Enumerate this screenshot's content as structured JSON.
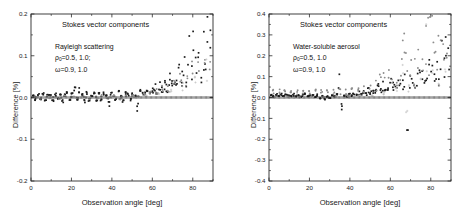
{
  "figure": {
    "background": "#ffffff",
    "panel_count": 2
  },
  "panels": [
    {
      "id": "left",
      "annotations": {
        "title": "Stokes vector components",
        "case": "Rayleigh scattering",
        "param1_symbol": "ρ",
        "param1_sub": "0",
        "param1_value": "=0.5, 1.0;",
        "param2_symbol": "ω",
        "param2_value": "=0.9, 1.0"
      },
      "axes": {
        "xlabel": "Observation angle [deg]",
        "ylabel": "Difference [%]",
        "xticks": [
          "0",
          "20",
          "40",
          "60",
          "80"
        ],
        "xtick_values": [
          0,
          20,
          40,
          60,
          80
        ],
        "yticks": [
          "0.2",
          "0.1",
          "0.0",
          "-0.1",
          "-0.2"
        ],
        "ytick_values": [
          0.2,
          0.1,
          0.0,
          -0.1,
          -0.2
        ],
        "xlim": [
          0,
          90
        ],
        "ylim": [
          -0.2,
          0.2
        ],
        "minor_x_step": 10,
        "minor_y_step": 0.05,
        "ticks_all_sides": true
      }
    },
    {
      "id": "right",
      "annotations": {
        "title": "Stokes vector components",
        "case": "Water-soluble aerosol",
        "param1_symbol": "ρ",
        "param1_sub": "0",
        "param1_value": "=0.5, 1.0",
        "param2_symbol": "ω",
        "param2_value": "=0.9, 1.0"
      },
      "axes": {
        "xlabel": "Observation angle [deg]",
        "ylabel": "Difference [%]",
        "xticks": [
          "0",
          "20",
          "40",
          "60",
          "80"
        ],
        "xtick_values": [
          0,
          20,
          40,
          60,
          80
        ],
        "yticks": [
          "0.4",
          "0.3",
          "0.2",
          "0.1",
          "0.0",
          "-0.1",
          "-0.2",
          "-0.3",
          "-0.4"
        ],
        "ytick_values": [
          0.4,
          0.3,
          0.2,
          0.1,
          0.0,
          -0.1,
          -0.2,
          -0.3,
          -0.4
        ],
        "xlim": [
          0,
          90
        ],
        "ylim": [
          -0.4,
          0.4
        ],
        "minor_x_step": 10,
        "minor_y_step": 0.05,
        "ticks_all_sides": true
      }
    }
  ],
  "bottom_caption": "",
  "colors": {
    "dark_marker": "#1c1c1c",
    "gray_marker": "#8c8c8c",
    "light_marker": "#bdbdbd",
    "axis": "#2b2b2b",
    "text": "#1a1a1a"
  },
  "chart_data": [
    {
      "type": "scatter",
      "panel": "left",
      "title": "Stokes vector components",
      "subtitle": "Rayleigh scattering",
      "xlabel": "Observation angle [deg]",
      "ylabel": "Difference [%]",
      "xlim": [
        0,
        90
      ],
      "ylim": [
        -0.2,
        0.2
      ],
      "grid": false,
      "legend": "none",
      "annotations": [
        "ρ₀=0.5, 1.0;",
        "ω=0.9, 1.0"
      ],
      "description": "Dense near-zero noise band for angles 0-60 deg (|diff| < 0.02%), fanning out to +0.17% near 88 deg. Three overlapping marker groups: dark squares, mid-gray circles, light-gray crosses.",
      "series": [
        {
          "name": "dark-squares",
          "color": "#1c1c1c",
          "marker": "square",
          "x": [
            1.2,
            2.4,
            3.6,
            4.8,
            6.0,
            7.2,
            8.4,
            9.6,
            10.8,
            12.0,
            13.2,
            14.4,
            15.6,
            16.8,
            18.0,
            19.2,
            20.4,
            21.6,
            22.8,
            24.0,
            25.2,
            26.4,
            27.6,
            28.8,
            30.0,
            31.2,
            32.4,
            33.6,
            34.8,
            36.0,
            37.2,
            38.4,
            39.6,
            40.8,
            42.0,
            43.2,
            44.4,
            45.6,
            46.8,
            48.0,
            49.2,
            50.4,
            51.6,
            52.8,
            54.0,
            55.2,
            56.4,
            57.6,
            58.8,
            60.0,
            61.2,
            62.4,
            63.6,
            64.8,
            66.0,
            67.2,
            68.4,
            69.6,
            70.8,
            72.0,
            73.2,
            74.4,
            75.6,
            76.8,
            78.0,
            79.2,
            80.4,
            81.6,
            82.8,
            84.0,
            85.2,
            86.4,
            87.6,
            88.8
          ],
          "y": [
            0.004,
            -0.005,
            0.006,
            -0.004,
            0.008,
            -0.007,
            0.005,
            0.009,
            -0.006,
            0.007,
            -0.003,
            0.01,
            -0.008,
            0.006,
            0.012,
            -0.005,
            0.014,
            0.018,
            -0.004,
            0.016,
            0.007,
            -0.009,
            0.011,
            -0.006,
            0.005,
            0.009,
            -0.012,
            0.008,
            -0.005,
            0.01,
            0.006,
            -0.014,
            0.009,
            0.004,
            -0.007,
            0.012,
            0.005,
            -0.009,
            0.011,
            0.007,
            -0.006,
            0.01,
            0.004,
            -0.029,
            0.013,
            0.008,
            0.011,
            0.017,
            0.009,
            0.015,
            0.022,
            0.012,
            0.028,
            0.018,
            0.035,
            0.024,
            0.042,
            0.031,
            0.055,
            0.038,
            0.065,
            0.047,
            0.072,
            0.052,
            0.095,
            0.061,
            0.104,
            0.068,
            0.085,
            0.058,
            0.112,
            0.074,
            0.168,
            0.155
          ]
        },
        {
          "name": "mid-gray-circles",
          "color": "#8c8c8c",
          "marker": "circle",
          "x": [
            2.0,
            5.0,
            8.0,
            11.0,
            14.0,
            17.0,
            20.0,
            23.0,
            26.0,
            29.0,
            32.0,
            35.0,
            38.0,
            41.0,
            44.0,
            47.0,
            50.0,
            53.0,
            56.0,
            59.0,
            62.0,
            65.0,
            68.0,
            71.0,
            74.0,
            77.0,
            80.0,
            83.0,
            86.0,
            88.5
          ],
          "y": [
            0.002,
            -0.002,
            0.003,
            0.001,
            -0.003,
            0.004,
            0.002,
            -0.001,
            0.003,
            -0.004,
            0.002,
            0.005,
            -0.002,
            0.003,
            -0.005,
            0.004,
            0.006,
            0.003,
            0.008,
            0.01,
            0.014,
            0.02,
            0.027,
            0.033,
            0.041,
            0.049,
            0.058,
            0.066,
            0.078,
            0.088
          ]
        },
        {
          "name": "light-gray-crosses",
          "color": "#bdbdbd",
          "marker": "cross",
          "x": [
            3.0,
            9.0,
            15.0,
            21.0,
            27.0,
            33.0,
            39.0,
            45.0,
            51.0,
            57.0,
            63.0,
            69.0,
            75.0,
            81.0,
            87.0
          ],
          "y": [
            0.001,
            0.0,
            -0.001,
            0.002,
            0.0,
            -0.002,
            0.001,
            0.0,
            0.002,
            0.004,
            0.008,
            0.016,
            0.027,
            0.04,
            0.06
          ]
        },
        {
          "name": "zero-baseline-ticks",
          "color": "#1c1c1c",
          "marker": "tick",
          "x": [
            0,
            90
          ],
          "y": [
            0.0,
            0.0
          ]
        }
      ]
    },
    {
      "type": "scatter",
      "panel": "right",
      "title": "Stokes vector components",
      "subtitle": "Water-soluble aerosol",
      "xlabel": "Observation angle [deg]",
      "ylabel": "Difference [%]",
      "xlim": [
        0,
        90
      ],
      "ylim": [
        -0.4,
        0.4
      ],
      "grid": false,
      "legend": "none",
      "annotations": [
        "ρ₀=0.5, 1.0",
        "ω=0.9, 1.0"
      ],
      "description": "A near-flat gray band at about +0.03% across all angles, dark noise band near zero, rising scatter after 55 deg with peaks to +0.39% near 80 deg and outliers down to -0.12% near 68 deg.",
      "series": [
        {
          "name": "dark-squares",
          "color": "#1c1c1c",
          "marker": "square",
          "x": [
            1.2,
            2.4,
            3.6,
            4.8,
            6.0,
            7.2,
            8.4,
            9.6,
            10.8,
            12.0,
            13.2,
            14.4,
            15.6,
            16.8,
            18.0,
            19.2,
            20.4,
            21.6,
            22.8,
            24.0,
            25.2,
            26.4,
            27.6,
            28.8,
            30.0,
            31.2,
            32.4,
            33.6,
            34.8,
            36.0,
            37.2,
            38.4,
            39.6,
            40.8,
            42.0,
            43.2,
            44.4,
            45.6,
            46.8,
            48.0,
            49.2,
            50.4,
            51.6,
            52.8,
            54.0,
            55.2,
            56.4,
            57.6,
            58.8,
            60.0,
            61.2,
            62.4,
            63.6,
            64.8,
            66.0,
            67.2,
            68.4,
            69.6,
            70.8,
            72.0,
            73.2,
            74.4,
            75.6,
            76.8,
            78.0,
            79.2,
            80.4,
            81.6,
            82.8,
            84.0,
            85.2,
            86.4,
            87.6,
            88.8
          ],
          "y": [
            0.01,
            0.006,
            0.012,
            0.008,
            0.014,
            0.007,
            0.011,
            0.016,
            0.009,
            0.013,
            0.006,
            0.015,
            0.004,
            0.012,
            0.018,
            0.007,
            0.014,
            0.009,
            0.003,
            0.011,
            -0.004,
            0.006,
            -0.008,
            0.005,
            -0.002,
            0.009,
            0.004,
            0.012,
            0.105,
            -0.042,
            0.01,
            0.006,
            0.014,
            0.008,
            0.016,
            0.01,
            0.022,
            0.014,
            0.027,
            0.018,
            0.031,
            0.021,
            0.038,
            0.025,
            0.045,
            0.029,
            0.052,
            0.034,
            0.041,
            0.06,
            0.048,
            0.072,
            0.055,
            0.085,
            0.062,
            0.078,
            -0.118,
            0.09,
            0.068,
            0.104,
            0.082,
            0.118,
            0.096,
            0.132,
            0.108,
            0.145,
            0.112,
            0.158,
            0.124,
            0.136,
            0.168,
            0.148,
            0.182,
            0.16
          ]
        },
        {
          "name": "mid-gray-circles",
          "color": "#8c8c8c",
          "marker": "circle",
          "x": [
            2.0,
            5.0,
            8.0,
            11.0,
            14.0,
            17.0,
            20.0,
            23.0,
            26.0,
            29.0,
            32.0,
            35.0,
            38.0,
            41.0,
            44.0,
            47.0,
            50.0,
            53.0,
            55.0,
            57.0,
            59.0,
            61.0,
            63.0,
            65.0,
            66.0,
            67.0,
            68.0,
            70.0,
            72.0,
            74.0,
            76.0,
            78.0,
            79.0,
            80.0,
            81.0,
            82.0,
            83.5,
            85.0,
            86.5,
            88.0
          ],
          "y": [
            0.03,
            0.029,
            0.031,
            0.03,
            0.028,
            0.031,
            0.03,
            0.029,
            0.03,
            0.032,
            0.03,
            0.029,
            0.031,
            0.033,
            0.036,
            0.042,
            0.055,
            0.068,
            0.082,
            0.096,
            0.09,
            0.078,
            0.082,
            0.14,
            0.196,
            0.205,
            0.152,
            0.116,
            0.12,
            0.152,
            0.186,
            0.34,
            0.296,
            0.386,
            0.262,
            0.238,
            0.28,
            0.276,
            0.19,
            0.178
          ]
        },
        {
          "name": "light-gray-crosses",
          "color": "#bdbdbd",
          "marker": "cross",
          "x": [
            3.0,
            9.0,
            15.0,
            21.0,
            27.0,
            33.0,
            39.0,
            45.0,
            51.0,
            57.0,
            63.0,
            66.0,
            68.0,
            69.0,
            72.0,
            75.0,
            78.0,
            81.0,
            84.0,
            87.0
          ],
          "y": [
            0.004,
            0.003,
            0.002,
            0.004,
            0.002,
            0.003,
            0.005,
            0.008,
            0.014,
            0.022,
            0.034,
            0.118,
            -0.06,
            0.046,
            0.056,
            0.072,
            0.214,
            0.096,
            0.118,
            0.13
          ]
        },
        {
          "name": "zero-baseline-ticks",
          "color": "#1c1c1c",
          "marker": "tick",
          "x": [
            0,
            90
          ],
          "y": [
            0.0,
            0.0
          ]
        }
      ]
    }
  ]
}
